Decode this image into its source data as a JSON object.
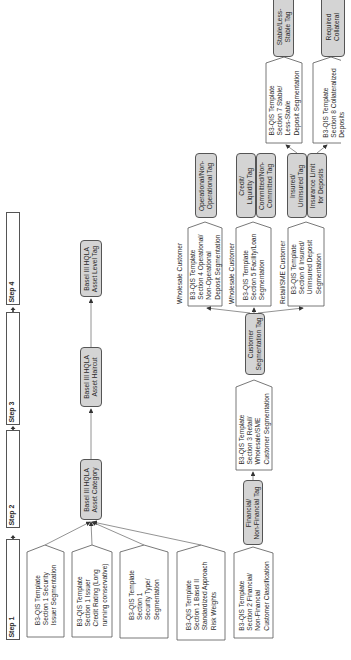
{
  "steps": [
    {
      "label": "Step 1"
    },
    {
      "label": "Step 2"
    },
    {
      "label": "Step 3"
    },
    {
      "label": "Step 4"
    }
  ],
  "basel": {
    "category": "Basel III HQLA\nAsset Category",
    "haircut": "Basel III HQLA\nAsset Haircut",
    "level_tag": "Basel III HQLA\nAsset Level Tag"
  },
  "section1": [
    {
      "text": "B3-QIS Template\nSection 1 Security\nIssuer Segmentation"
    },
    {
      "text": "B3-QIS Template\nSection 1 Issuer\nCredit Rating (Long\nrunning conservative)"
    },
    {
      "text": "B3-QIS Template\nSection 1\nSecurity Type/\nSegmentation"
    },
    {
      "text": "B3-QIS Template\nSection 1 Basel II\nStandardized Approach\nRisk Weights"
    }
  ],
  "section2": {
    "text": "B3-QIS Template\nSection 2 Financial/\nNon-Financial\nCustomer Classification"
  },
  "financial_tag": {
    "text": "Financial/\nNon-Financial Tag"
  },
  "section3": {
    "text": "B3-QIS Template\nSection 3 Retail/\nWholesale/SME\nCustomer Segmentation"
  },
  "customer_seg_tag": {
    "text": "Customer\nSegmentation Tag"
  },
  "section4": {
    "label": "Wholesale Customer",
    "text": "B3-QIS Template\nSection 4 Operational/\nNon-Operational\nDeposit Segmentation"
  },
  "section5": {
    "label": "Wholesale Customer",
    "text": "B3-QIS Template\nSection 5 Facility/Loan\nSegmentation"
  },
  "section6": {
    "label": "Retail/SME Customer",
    "text": "B3-QIS Template\nSection 6 Insured/\nUninsured Deposit\nSegmentation"
  },
  "operational_tag": {
    "text": "Operational/Non-\nOperational Tag"
  },
  "credit_liquidity_tag": {
    "text": "Credit/\nLiquidity Tag"
  },
  "committed_tag": {
    "text": "Committed/Non-\nCommitted Tag"
  },
  "insured_tag": {
    "text": "Insured/\nUninsured Tag"
  },
  "insurance_limit_tag": {
    "text": "Insurance Limit\nfor Deposits"
  },
  "section7": {
    "text": "B3-QIS Template\nSection 7 Stable/\nLess-Stable\nDeposit Segmentation"
  },
  "stable_tag": {
    "text": "Stable/Less-\nStable Tag"
  },
  "section8": {
    "text": "B3-QIS Template\nSection 8 Collateralized\nDeposits"
  },
  "collateral_tag": {
    "text": "Required\nCollateral"
  }
}
